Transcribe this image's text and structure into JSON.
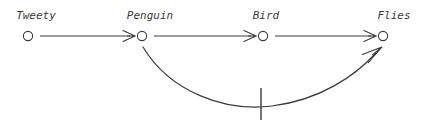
{
  "figure": {
    "width": 424,
    "height": 126,
    "background_color": "#ffffff",
    "ink_color": "#3a3a3a"
  },
  "nodes": [
    {
      "id": "tweety",
      "label": "Tweety",
      "cx": 28,
      "cy": 36,
      "r": 4.6,
      "label_x": 36,
      "label_y": 19
    },
    {
      "id": "penguin",
      "label": "Penguin",
      "cx": 142,
      "cy": 36,
      "r": 4.6,
      "label_x": 150,
      "label_y": 19
    },
    {
      "id": "bird",
      "label": "Bird",
      "cx": 263,
      "cy": 36,
      "r": 4.6,
      "label_x": 266,
      "label_y": 19
    },
    {
      "id": "flies",
      "label": "Flies",
      "cx": 383,
      "cy": 36,
      "r": 4.6,
      "label_x": 394,
      "label_y": 19
    }
  ],
  "edges": [
    {
      "id": "tweety-penguin",
      "from": "tweety",
      "to": "penguin",
      "kind": "straight",
      "strict": true,
      "negated": false,
      "path": "M 40 36 L 130 36",
      "arrow_tip": {
        "x": 135,
        "y": 36
      },
      "arrow_angle_deg": 0
    },
    {
      "id": "penguin-bird",
      "from": "penguin",
      "to": "bird",
      "kind": "straight",
      "strict": true,
      "negated": false,
      "path": "M 154 36 L 251 36",
      "arrow_tip": {
        "x": 256,
        "y": 36
      },
      "arrow_angle_deg": 0
    },
    {
      "id": "bird-flies",
      "from": "bird",
      "to": "flies",
      "kind": "straight",
      "strict": true,
      "negated": false,
      "path": "M 275 36 L 371 36",
      "arrow_tip": {
        "x": 376,
        "y": 36
      },
      "arrow_angle_deg": 0
    },
    {
      "id": "penguin-flies-negated",
      "from": "penguin",
      "to": "flies",
      "kind": "curved",
      "strict": false,
      "negated": true,
      "path": "M 143 47 C 170 92, 225 112, 272 106 C 320 100, 355 76, 376 53",
      "arrow_tip": {
        "x": 382,
        "y": 47
      },
      "arrow_angle_deg": -47
    }
  ],
  "negation_marks": [
    {
      "id": "penguin-flies-strike",
      "on_edge": "penguin-flies-negated",
      "x": 261,
      "y1": 88,
      "y2": 120
    }
  ]
}
